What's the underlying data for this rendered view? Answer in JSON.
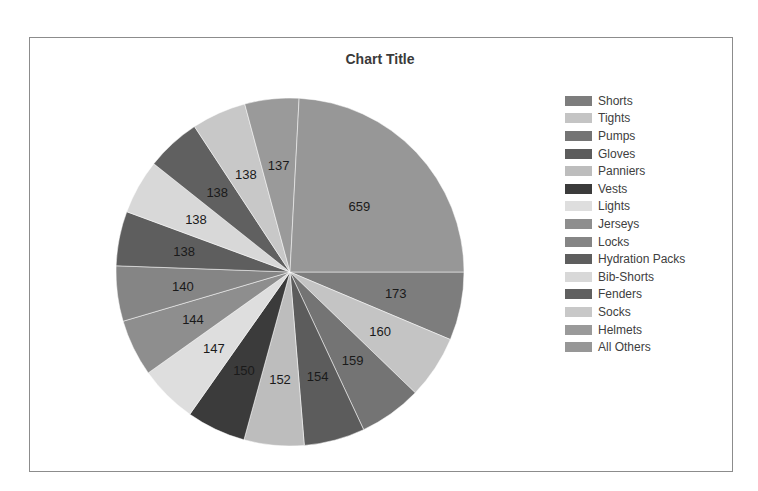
{
  "chart_data": {
    "type": "pie",
    "title": "Chart Title",
    "legend_position": "right",
    "start_angle_deg": 90,
    "categories": [
      "Shorts",
      "Tights",
      "Pumps",
      "Gloves",
      "Panniers",
      "Vests",
      "Lights",
      "Jerseys",
      "Locks",
      "Hydration Packs",
      "Bib-Shorts",
      "Fenders",
      "Socks",
      "Helmets",
      "All Others"
    ],
    "values": [
      173,
      160,
      159,
      154,
      152,
      150,
      147,
      144,
      140,
      138,
      138,
      138,
      138,
      137,
      659
    ],
    "colors": [
      "#7d7d7d",
      "#c4c4c4",
      "#747474",
      "#5c5c5c",
      "#bdbdbd",
      "#3b3b3b",
      "#dedede",
      "#8e8e8e",
      "#858585",
      "#5e5e5e",
      "#d8d8d8",
      "#606060",
      "#c8c8c8",
      "#9a9a9a",
      "#979797"
    ]
  },
  "chart": {
    "title": "Chart Title"
  }
}
